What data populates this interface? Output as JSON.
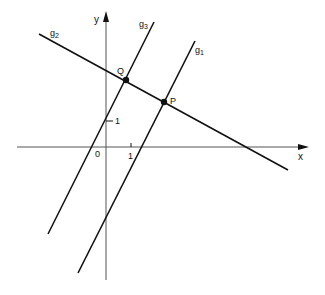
{
  "diagram": {
    "colors": {
      "ink": "#111111",
      "background": "#ffffff"
    },
    "axes": {
      "x_label": "x",
      "y_label": "y",
      "origin_label": "0",
      "x_tick_label": "1",
      "y_tick_label": "1"
    },
    "lines": [
      {
        "name": "g1",
        "label": "g",
        "subscript": "1"
      },
      {
        "name": "g2",
        "label": "g",
        "subscript": "2"
      },
      {
        "name": "g3",
        "label": "g",
        "subscript": "3"
      }
    ],
    "points": [
      {
        "name": "Q",
        "label": "Q"
      },
      {
        "name": "P",
        "label": "P"
      }
    ]
  }
}
